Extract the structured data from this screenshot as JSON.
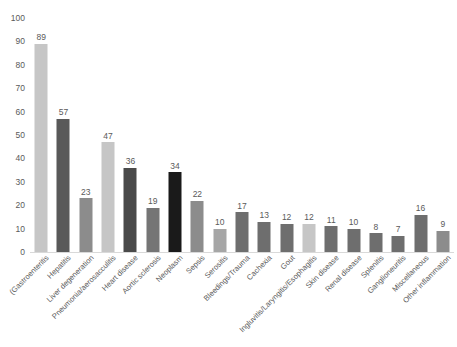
{
  "chart_data": {
    "type": "bar",
    "title": "",
    "subtitle": "",
    "xlabel": "",
    "ylabel": "",
    "ylim": [
      0,
      100
    ],
    "grid": false,
    "legend": "none",
    "yticks": [
      "0",
      "10",
      "20",
      "30",
      "40",
      "50",
      "60",
      "70",
      "80",
      "90",
      "100"
    ],
    "categories": [
      "(Gastroenteritis",
      "Hepatitis",
      "Liver degeneration",
      "Pneumonia/aerosacculitis",
      "Heart disease",
      "Aortic sclerosis",
      "Neoplasm",
      "Sepsis",
      "Serositis",
      "Bleedings/Trauma",
      "Cachexia",
      "Gout",
      "Ingluvitis/Laryngitis/Esophagitis",
      "Skin disease",
      "Renal disease",
      "Splenitis",
      "Ganglioneuritis",
      "Miscellaneous",
      "Other inflammation"
    ],
    "values": [
      89,
      57,
      23,
      47,
      36,
      19,
      34,
      22,
      10,
      17,
      13,
      12,
      12,
      11,
      10,
      8,
      7,
      16,
      9
    ],
    "labels": [
      "89",
      "57",
      "23",
      "47",
      "36",
      "19",
      "34",
      "22",
      "10",
      "17",
      "13",
      "12",
      "12",
      "11",
      "10",
      "8",
      "7",
      "16",
      "9"
    ],
    "bar_colors": [
      "#c6c6c6",
      "#595959",
      "#8c8c8c",
      "#c6c6c6",
      "#4a4a4a",
      "#757575",
      "#1a1a1a",
      "#8c8c8c",
      "#a6a6a6",
      "#6e6e6e",
      "#6e6e6e",
      "#6e6e6e",
      "#c6c6c6",
      "#6e6e6e",
      "#6e6e6e",
      "#6e6e6e",
      "#6e6e6e",
      "#6e6e6e",
      "#8c8c8c"
    ],
    "axis_color": "#d9d9d9",
    "text_color": "#5a5a5a",
    "background": "#ffffff"
  }
}
